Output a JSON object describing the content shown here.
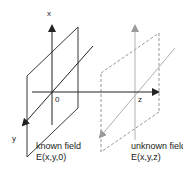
{
  "diagram": {
    "type": "field-propagation-schematic",
    "colors": {
      "known": "#222222",
      "unknown": "#9a9a9a",
      "background": "#ffffff"
    },
    "axes": {
      "x_label": "x",
      "y_label": "y",
      "z_label": "z",
      "origin_label": "0"
    },
    "planes": [
      {
        "id": "known",
        "title": "known field",
        "expression": "E(x,y,0)",
        "style": "solid",
        "position_label": "0"
      },
      {
        "id": "unknown",
        "title": "unknown field",
        "expression": "E(x,y,z)",
        "style": "dashed",
        "position_label": "z"
      }
    ]
  }
}
